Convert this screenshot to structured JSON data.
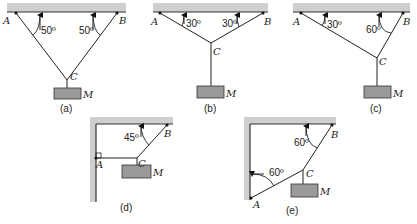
{
  "figure": {
    "panels": [
      {
        "id": "a",
        "caption": "(a)",
        "points": {
          "A": "A",
          "B": "B",
          "C": "C"
        },
        "mass": "M",
        "angles": {
          "A": "50º",
          "B": "50º"
        }
      },
      {
        "id": "b",
        "caption": "(b)",
        "points": {
          "A": "A",
          "B": "B",
          "C": "C"
        },
        "mass": "M",
        "angles": {
          "A": "30º",
          "B": "30º"
        }
      },
      {
        "id": "c",
        "caption": "(c)",
        "points": {
          "A": "A",
          "B": "B",
          "C": "C"
        },
        "mass": "M",
        "angles": {
          "A": "30º",
          "B": "60º"
        }
      },
      {
        "id": "d",
        "caption": "(d)",
        "points": {
          "A": "A",
          "B": "B",
          "C": "C"
        },
        "mass": "M",
        "angles": {
          "B": "45º"
        }
      },
      {
        "id": "e",
        "caption": "(e)",
        "points": {
          "A": "A",
          "B": "B",
          "C": "C"
        },
        "mass": "M",
        "angles": {
          "A": "60º",
          "B": "60º"
        }
      }
    ],
    "colors": {
      "support": "#cfcfcf",
      "mass": "#9a9a9a",
      "line": "#222222"
    }
  }
}
